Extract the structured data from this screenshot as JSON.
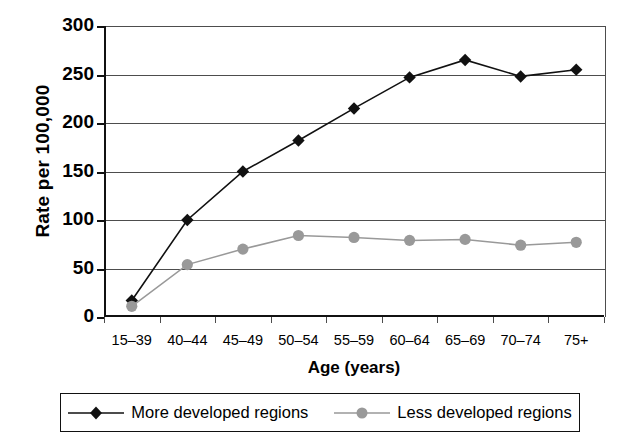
{
  "chart_data": {
    "type": "line",
    "title": "",
    "xlabel": "Age (years)",
    "ylabel": "Rate per 100,000",
    "categories": [
      "15–39",
      "40–44",
      "45–49",
      "50–54",
      "55–59",
      "60–64",
      "65–69",
      "70–74",
      "75+"
    ],
    "ylim": [
      0,
      300
    ],
    "yticks": [
      0,
      50,
      100,
      150,
      200,
      250,
      300
    ],
    "ytick_labels": [
      "0",
      "50",
      "100",
      "150",
      "200",
      "250",
      "300"
    ],
    "grid": true,
    "legend_position": "bottom",
    "series": [
      {
        "name": "More developed regions",
        "marker": "diamond",
        "color": "#111111",
        "values": [
          17,
          100,
          150,
          182,
          215,
          247,
          265,
          248,
          255
        ]
      },
      {
        "name": "Less developed regions",
        "marker": "circle",
        "color": "#999999",
        "values": [
          11,
          54,
          70,
          84,
          82,
          79,
          80,
          74,
          77
        ]
      }
    ]
  },
  "axes": {
    "y_title": "Rate per 100,000",
    "x_title": "Age (years)"
  },
  "legend": {
    "items": [
      {
        "label": "More developed regions",
        "marker": "diamond-marker-icon",
        "color": "#111111"
      },
      {
        "label": "Less developed regions",
        "marker": "circle-marker-icon",
        "color": "#999999"
      }
    ]
  }
}
